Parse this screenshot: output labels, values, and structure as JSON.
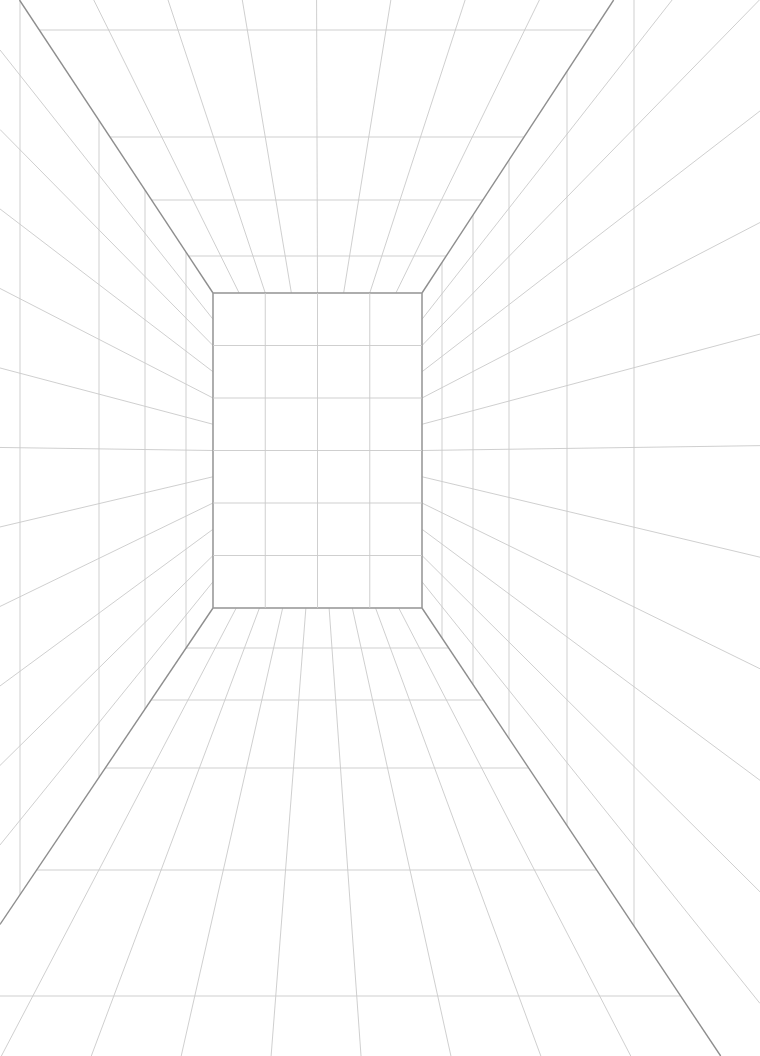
{
  "drawing": {
    "type": "one-point perspective room grid",
    "colors": {
      "background": "#ffffff",
      "grid": "#c9c9c9",
      "edges": "#8e8e8e",
      "back_wall": "#9a9a9a"
    },
    "vanishing_point": [
      318,
      452
    ],
    "back_wall": {
      "x": 213,
      "y": 293,
      "w": 209,
      "h": 315,
      "cols": 4,
      "rows": 6
    },
    "room_corners": {
      "top_left": [
        10,
        10
      ],
      "top_right": [
        585,
        0
      ],
      "bottom_left": [
        0,
        895
      ],
      "bottom_right": [
        635,
        1056
      ]
    },
    "ceiling_depth_lines_y": [
      30,
      137,
      200,
      256
    ],
    "floor_depth_lines_y": [
      648,
      700,
      768,
      870,
      996
    ],
    "left_wall_verticals_x": [
      20,
      99,
      145,
      186
    ],
    "right_wall_verticals_x": [
      442,
      473,
      509,
      567,
      634
    ]
  }
}
